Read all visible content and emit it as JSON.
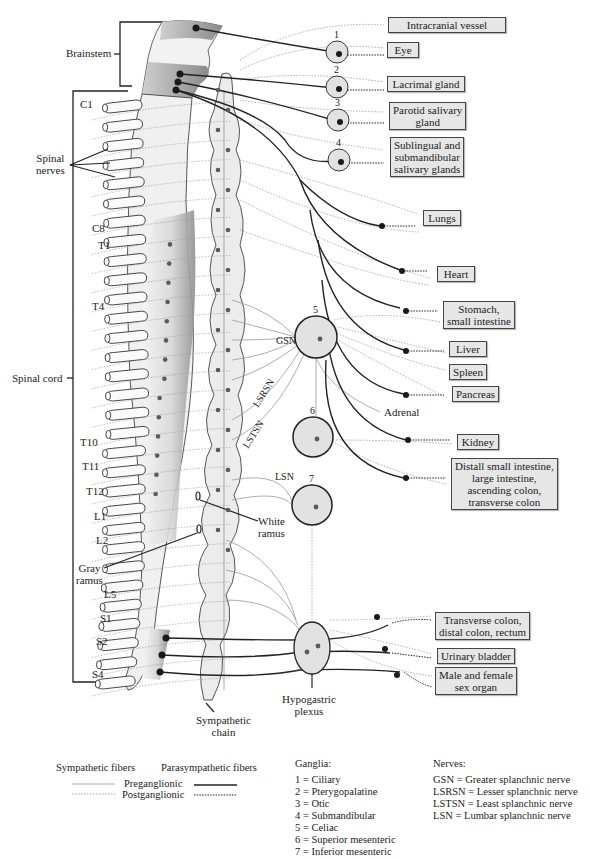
{
  "diagram": {
    "colors": {
      "ink": "#222222",
      "sympathetic_line": "#8a8a8a",
      "organ_box_fill": "#e6e6e6",
      "ganglion_fill": "#e2e2e2",
      "cord_shade": "#9a9a9a",
      "neuron_dot": "#5a5a5a",
      "para_dot": "#1a1a1a"
    },
    "region_labels": {
      "brainstem": "Brainstem",
      "spinal_nerves": "Spinal\nnerves",
      "spinal_cord": "Spinal cord",
      "gray_ramus": "Gray\nramus",
      "white_ramus": "White\nramus",
      "sympathetic_chain": "Sympathetic\nchain",
      "hypogastric_plexus": "Hypogastric\nplexus",
      "adrenal": "Adrenal"
    },
    "segment_labels": [
      {
        "label": "C1",
        "x": 80,
        "y": 108
      },
      {
        "label": "C8",
        "x": 92,
        "y": 232
      },
      {
        "label": "T1",
        "x": 98,
        "y": 249
      },
      {
        "label": "T4",
        "x": 92,
        "y": 310
      },
      {
        "label": "T10",
        "x": 80,
        "y": 446
      },
      {
        "label": "T11",
        "x": 82,
        "y": 470
      },
      {
        "label": "T12",
        "x": 86,
        "y": 495
      },
      {
        "label": "L1",
        "x": 94,
        "y": 520
      },
      {
        "label": "L2",
        "x": 96,
        "y": 544
      },
      {
        "label": "L5",
        "x": 104,
        "y": 598
      },
      {
        "label": "S1",
        "x": 100,
        "y": 622
      },
      {
        "label": "S2",
        "x": 96,
        "y": 645
      },
      {
        "label": "S4",
        "x": 92,
        "y": 678
      }
    ],
    "nerve_labels": [
      {
        "label": "GSN",
        "x": 276,
        "y": 344
      },
      {
        "label": "LSRSN",
        "x": 258,
        "y": 408,
        "rotate": -58
      },
      {
        "label": "LSTSN",
        "x": 248,
        "y": 449,
        "rotate": -58
      },
      {
        "label": "LSN",
        "x": 275,
        "y": 480
      }
    ],
    "ganglia": [
      {
        "number": "1",
        "name": "Ciliary",
        "cx": 337,
        "cy": 52,
        "r": 11
      },
      {
        "number": "2",
        "name": "Pterygopalatine",
        "cx": 337,
        "cy": 87,
        "r": 11
      },
      {
        "number": "3",
        "name": "Otic",
        "cx": 338,
        "cy": 120,
        "r": 11
      },
      {
        "number": "4",
        "name": "Submandibular",
        "cx": 339,
        "cy": 160,
        "r": 11
      },
      {
        "number": "5",
        "name": "Celiac",
        "cx": 316,
        "cy": 337,
        "r": 21
      },
      {
        "number": "6",
        "name": "Superior mesenteric",
        "cx": 313,
        "cy": 437,
        "r": 20
      },
      {
        "number": "7",
        "name": "Inferior mesenteric",
        "cx": 312,
        "cy": 505,
        "r": 20
      }
    ],
    "organs": [
      {
        "id": "intracranial-vessel",
        "label": "Intracranial vessel",
        "x": 388,
        "y": 17,
        "w": 110
      },
      {
        "id": "eye",
        "label": "Eye",
        "x": 387,
        "y": 42,
        "w": 24
      },
      {
        "id": "lacrimal-gland",
        "label": "Lacrimal gland",
        "x": 387,
        "y": 76,
        "w": 70
      },
      {
        "id": "parotid-salivary-gland",
        "label": "Parotid salivary\ngland",
        "x": 389,
        "y": 102,
        "w": 68
      },
      {
        "id": "sublingual-submandibular",
        "label": "Sublingual and\nsubmandibular\nsalivary glands",
        "x": 390,
        "y": 137,
        "w": 66
      },
      {
        "id": "lungs",
        "label": "Lungs",
        "x": 423,
        "y": 210,
        "w": 30
      },
      {
        "id": "heart",
        "label": "Heart",
        "x": 437,
        "y": 266,
        "w": 30
      },
      {
        "id": "stomach-small-intestine",
        "label": "Stomach,\nsmall intestine",
        "x": 443,
        "y": 301,
        "w": 62
      },
      {
        "id": "liver",
        "label": "Liver",
        "x": 449,
        "y": 341,
        "w": 30
      },
      {
        "id": "spleen",
        "label": "Spleen",
        "x": 449,
        "y": 364,
        "w": 30
      },
      {
        "id": "pancreas",
        "label": "Pancreas",
        "x": 452,
        "y": 386,
        "w": 38
      },
      {
        "id": "kidney",
        "label": "Kidney",
        "x": 457,
        "y": 434,
        "w": 34
      },
      {
        "id": "distal-small-intestine",
        "label": "Distall small intestine,\nlarge intestine,\nascending colon,\ntransverse colon",
        "x": 451,
        "y": 458,
        "w": 95
      },
      {
        "id": "transverse-colon-rectum",
        "label": "Transverse colon,\ndistal colon, rectum",
        "x": 435,
        "y": 612,
        "w": 86
      },
      {
        "id": "urinary-bladder",
        "label": "Urinary bladder",
        "x": 437,
        "y": 648,
        "w": 66
      },
      {
        "id": "sex-organ",
        "label": "Male and female\nsex organ",
        "x": 435,
        "y": 667,
        "w": 72
      }
    ],
    "legend": {
      "fibers": {
        "sympathetic_header": "Sympathetic fibers",
        "parasympathetic_header": "Parasympathetic fibers",
        "preganglionic": "Preganglionic",
        "postganglionic": "Postganglionic"
      },
      "ganglia_header": "Ganglia:",
      "ganglia_items": [
        "1 = Ciliary",
        "2 = Pterygopalatine",
        "3 = Otic",
        "4 = Submandibular",
        "5 = Celiac",
        "6 = Superior mesenteric",
        "7 = Inferior mesenteric"
      ],
      "nerves_header": "Nerves:",
      "nerves_items": [
        "GSN = Greater splanchnic nerve",
        "LSRSN = Lesser splanchnic nerve",
        "LSTSN = Least splanchnic nerve",
        "LSN = Lumbar splanchnic nerve"
      ]
    },
    "caption_fragment": "3.1. Sympathetic and parasympathetic innervation of organs"
  }
}
